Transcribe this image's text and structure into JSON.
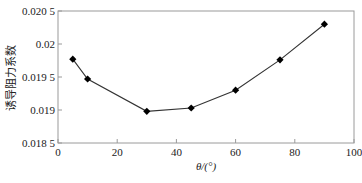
{
  "chart_data": {
    "type": "line",
    "title": "",
    "xlabel": "θ/(°)",
    "ylabel": "诱导阻力系数",
    "x": [
      5,
      10,
      30,
      45,
      60,
      75,
      90
    ],
    "series": [
      {
        "name": "诱导阻力系数",
        "values": [
          0.01977,
          0.01947,
          0.01898,
          0.01903,
          0.0193,
          0.01976,
          0.0203
        ],
        "marker": "diamond",
        "color": "#000000"
      }
    ],
    "xlim": [
      0,
      100
    ],
    "ylim": [
      0.0185,
      0.0205
    ],
    "x_ticks": [
      0,
      20,
      40,
      60,
      80,
      100
    ],
    "x_tick_labels": [
      "0",
      "20",
      "40",
      "60",
      "80",
      "100"
    ],
    "y_ticks": [
      0.0185,
      0.019,
      0.0195,
      0.02,
      0.0205
    ],
    "y_tick_labels": [
      "0.018 5",
      "0.019",
      "0.019 5",
      "0.02",
      "0.020 5"
    ],
    "grid": false,
    "legend": "none"
  },
  "colors": {
    "axis": "#9a9a9a",
    "line": "#333333",
    "marker": "#000000"
  }
}
